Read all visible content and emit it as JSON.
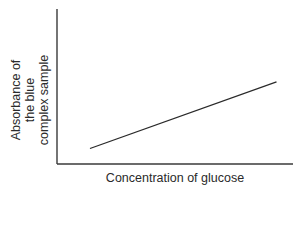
{
  "chart_data": {
    "type": "line",
    "title": "",
    "xlabel": "Concentration of glucose",
    "ylabel_lines": [
      "Absorbance of",
      "the blue",
      "complex sample"
    ],
    "ylabel": "Absorbance of the blue complex sample",
    "grid": false,
    "legend": null,
    "ticks": false,
    "series": [
      {
        "name": "absorbance",
        "x": [
          0.14,
          0.93
        ],
        "y": [
          0.1,
          0.53
        ],
        "description": "straight line, positive linear relationship"
      }
    ],
    "xlim": [
      0,
      1
    ],
    "ylim": [
      0,
      1
    ]
  },
  "colors": {
    "axis": "#3a3a3a",
    "line": "#2a2a2a",
    "background": "#ffffff"
  }
}
